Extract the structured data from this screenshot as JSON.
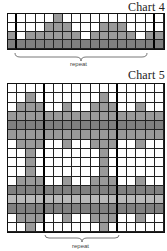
{
  "charts": [
    {
      "title": "Chart 4",
      "rows": 4,
      "cols": 17,
      "thick_after_cols": [
        0,
        15
      ],
      "repeat_label": "repeat",
      "cells": [
        [
          0,
          0,
          0,
          0,
          0,
          2,
          0,
          0,
          0,
          0,
          0,
          0,
          0,
          0,
          0,
          0,
          0
        ],
        [
          0,
          0,
          0,
          0,
          2,
          2,
          2,
          0,
          0,
          0,
          2,
          2,
          2,
          0,
          0,
          0,
          0
        ],
        [
          2,
          0,
          2,
          2,
          2,
          2,
          2,
          2,
          0,
          2,
          2,
          2,
          2,
          2,
          0,
          2,
          2
        ],
        [
          3,
          3,
          3,
          3,
          3,
          3,
          3,
          3,
          3,
          3,
          3,
          3,
          3,
          3,
          3,
          3,
          3
        ]
      ]
    },
    {
      "title": "Chart 5",
      "rows": 16,
      "cols": 17,
      "thick_after_cols": [
        3,
        11
      ],
      "repeat_label": "repeat",
      "cells": [
        [
          0,
          0,
          0,
          0,
          0,
          0,
          0,
          0,
          0,
          0,
          0,
          0,
          0,
          0,
          0,
          0,
          0
        ],
        [
          0,
          0,
          2,
          0,
          0,
          0,
          0,
          0,
          0,
          0,
          2,
          0,
          0,
          0,
          0,
          0,
          0
        ],
        [
          0,
          2,
          2,
          2,
          0,
          0,
          2,
          0,
          0,
          2,
          2,
          2,
          0,
          0,
          2,
          0,
          0
        ],
        [
          2,
          2,
          2,
          2,
          2,
          2,
          2,
          2,
          2,
          2,
          2,
          2,
          2,
          2,
          2,
          2,
          2
        ],
        [
          3,
          3,
          3,
          3,
          3,
          3,
          3,
          3,
          3,
          3,
          3,
          3,
          3,
          3,
          3,
          3,
          3
        ],
        [
          2,
          2,
          2,
          2,
          2,
          2,
          2,
          2,
          2,
          2,
          2,
          2,
          2,
          2,
          2,
          2,
          2
        ],
        [
          0,
          2,
          2,
          2,
          0,
          0,
          2,
          0,
          0,
          2,
          2,
          2,
          0,
          0,
          2,
          0,
          0
        ],
        [
          0,
          0,
          2,
          0,
          0,
          0,
          0,
          0,
          0,
          0,
          2,
          0,
          0,
          0,
          0,
          0,
          0
        ],
        [
          0,
          0,
          2,
          0,
          0,
          0,
          0,
          0,
          0,
          0,
          2,
          0,
          0,
          0,
          0,
          0,
          0
        ],
        [
          0,
          0,
          2,
          0,
          0,
          0,
          0,
          0,
          0,
          0,
          2,
          0,
          0,
          0,
          0,
          0,
          0
        ],
        [
          0,
          2,
          2,
          2,
          0,
          0,
          2,
          0,
          0,
          2,
          2,
          2,
          0,
          0,
          2,
          0,
          0
        ],
        [
          3,
          3,
          3,
          3,
          3,
          3,
          3,
          3,
          3,
          3,
          3,
          3,
          3,
          3,
          3,
          3,
          3
        ],
        [
          1,
          1,
          1,
          1,
          1,
          1,
          1,
          1,
          1,
          1,
          1,
          1,
          1,
          1,
          1,
          1,
          1
        ],
        [
          3,
          3,
          3,
          3,
          3,
          3,
          3,
          3,
          3,
          3,
          3,
          3,
          3,
          3,
          3,
          3,
          3
        ],
        [
          0,
          2,
          2,
          2,
          0,
          0,
          2,
          0,
          0,
          2,
          2,
          2,
          0,
          0,
          2,
          0,
          0
        ],
        [
          0,
          0,
          2,
          0,
          0,
          0,
          0,
          0,
          0,
          0,
          2,
          0,
          0,
          0,
          0,
          0,
          0
        ]
      ]
    }
  ]
}
